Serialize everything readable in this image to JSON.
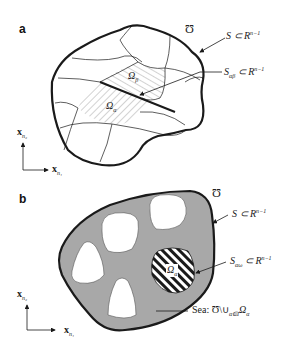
{
  "panel_a": {
    "letter": "a",
    "domain_symbol": "Ʊ",
    "boundary_label": {
      "main": "S ⊂ R",
      "sup": "n−1"
    },
    "interface_label": {
      "main": "S",
      "sub": "αβ",
      "rest": " ⊂ R",
      "sup": "n−1"
    },
    "region_beta": {
      "main": "Ω",
      "sub": "β"
    },
    "region_alpha": {
      "main": "Ω",
      "sub": "α"
    },
    "axis_y": {
      "main": "x",
      "sub": "n₂"
    },
    "axis_x": {
      "main": "x",
      "sub": "n₁"
    }
  },
  "panel_b": {
    "letter": "b",
    "domain_symbol": "Ʊ",
    "boundary_label": {
      "main": "S ⊂ R",
      "sup": "n−1"
    },
    "interface_label": {
      "main": "S",
      "sub": "αω",
      "rest": " ⊂ R",
      "sup": "n−1"
    },
    "region_alpha": {
      "main": "Ω",
      "sub": "α"
    },
    "sea_label": {
      "prefix": "Sea: Ʊ\\∪",
      "sub": "α∈I",
      "suffix": "Ω",
      "sub2": "α"
    },
    "axis_y": {
      "main": "x",
      "sub": "n₂"
    },
    "axis_x": {
      "main": "x",
      "sub": "n₁"
    }
  },
  "colors": {
    "stroke": "#1a1a1a",
    "sea_fill": "#a8a8a8",
    "hatch": "#555555"
  }
}
